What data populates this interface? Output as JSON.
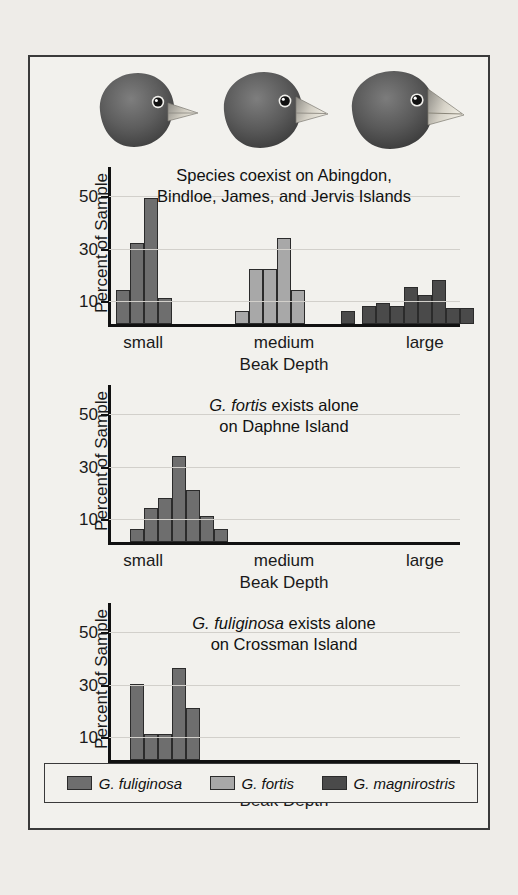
{
  "figure": {
    "ylabel": "Percent of Sample",
    "xlabel": "Beak Depth",
    "xcats": [
      "small",
      "medium",
      "large"
    ],
    "yticks": [
      10,
      30,
      50
    ]
  },
  "species": {
    "fuliginosa": {
      "name": "G. fuliginosa",
      "color": "#6e6e6e"
    },
    "fortis": {
      "name": "G. fortis",
      "color": "#a8a8a8"
    },
    "magnirostris": {
      "name": "G. magnirostris",
      "color": "#4a4a4a"
    }
  },
  "legend": {
    "items": [
      {
        "label": "G. fuliginosa",
        "color": "#6e6e6e",
        "icon": "legend-swatch"
      },
      {
        "label": "G. fortis",
        "color": "#a8a8a8",
        "icon": "legend-swatch"
      },
      {
        "label": "G. magnirostris",
        "color": "#4a4a4a",
        "icon": "legend-swatch"
      }
    ]
  },
  "finches": [
    {
      "name": "finch-small-beak",
      "beak": "small"
    },
    {
      "name": "finch-medium-beak",
      "beak": "medium"
    },
    {
      "name": "finch-large-beak",
      "beak": "large"
    }
  ],
  "chart_data": [
    {
      "id": "panel-1",
      "type": "bar",
      "title": "Species coexist on Abingdon, Bindloe, James, and Jervis Islands",
      "title_line1": "Species coexist on Abingdon,",
      "title_line2": "Bindloe, James, and Jervis Islands",
      "xlabel": "Beak Depth",
      "ylabel": "Percent of Sample",
      "ylim": [
        0,
        60
      ],
      "yticks": [
        10,
        30,
        50
      ],
      "categories": [
        "small",
        "medium",
        "large"
      ],
      "grid": true,
      "legend_position": "bottom",
      "series": [
        {
          "name": "G. fuliginosa",
          "color": "#6e6e6e",
          "bars": [
            {
              "x": 0.055,
              "value": 13
            },
            {
              "x": 0.095,
              "value": 31
            },
            {
              "x": 0.135,
              "value": 48
            },
            {
              "x": 0.175,
              "value": 10
            }
          ]
        },
        {
          "name": "G. fortis",
          "color": "#a8a8a8",
          "bars": [
            {
              "x": 0.395,
              "value": 5
            },
            {
              "x": 0.435,
              "value": 21
            },
            {
              "x": 0.475,
              "value": 21
            },
            {
              "x": 0.515,
              "value": 33
            },
            {
              "x": 0.555,
              "value": 13
            }
          ]
        },
        {
          "name": "G. magnirostris",
          "color": "#4a4a4a",
          "bars": [
            {
              "x": 0.7,
              "value": 5
            },
            {
              "x": 0.76,
              "value": 7
            },
            {
              "x": 0.8,
              "value": 8
            },
            {
              "x": 0.84,
              "value": 7
            },
            {
              "x": 0.88,
              "value": 14
            },
            {
              "x": 0.92,
              "value": 11
            },
            {
              "x": 0.96,
              "value": 17
            },
            {
              "x": 1.0,
              "value": 6
            },
            {
              "x": 1.04,
              "value": 6
            }
          ]
        }
      ]
    },
    {
      "id": "panel-2",
      "type": "bar",
      "title": "G. fortis exists alone on Daphne Island",
      "title_line1_italic": "G. fortis",
      "title_line1_rest": " exists alone",
      "title_line2": "on Daphne Island",
      "xlabel": "Beak Depth",
      "ylabel": "Percent of Sample",
      "ylim": [
        0,
        60
      ],
      "yticks": [
        10,
        30,
        50
      ],
      "categories": [
        "small",
        "medium",
        "large"
      ],
      "grid": true,
      "series": [
        {
          "name": "G. fortis",
          "color": "#6e6e6e",
          "bars": [
            {
              "x": 0.095,
              "value": 5
            },
            {
              "x": 0.135,
              "value": 13
            },
            {
              "x": 0.175,
              "value": 17
            },
            {
              "x": 0.215,
              "value": 33
            },
            {
              "x": 0.255,
              "value": 20
            },
            {
              "x": 0.295,
              "value": 10
            },
            {
              "x": 0.335,
              "value": 5
            }
          ]
        }
      ]
    },
    {
      "id": "panel-3",
      "type": "bar",
      "title": "G. fuliginosa exists alone on Crossman Island",
      "title_line1_italic": "G. fuliginosa",
      "title_line1_rest": " exists alone",
      "title_line2": "on Crossman Island",
      "xlabel": "Beak Depth",
      "ylabel": "Percent of Sample",
      "ylim": [
        0,
        60
      ],
      "yticks": [
        10,
        30,
        50
      ],
      "categories": [
        "small",
        "medium",
        "large"
      ],
      "grid": true,
      "series": [
        {
          "name": "G. fuliginosa",
          "color": "#6e6e6e",
          "bars": [
            {
              "x": 0.095,
              "value": 29
            },
            {
              "x": 0.135,
              "value": 10
            },
            {
              "x": 0.175,
              "value": 10
            },
            {
              "x": 0.215,
              "value": 35
            },
            {
              "x": 0.255,
              "value": 20
            }
          ]
        }
      ]
    }
  ]
}
